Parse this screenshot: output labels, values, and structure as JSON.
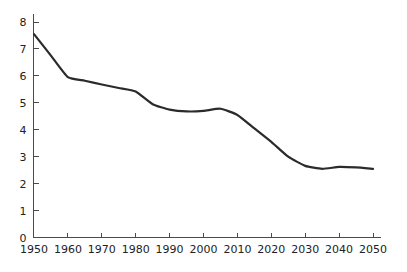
{
  "chart_data": {
    "type": "line",
    "title": "",
    "subtitle": "",
    "xlabel": "",
    "ylabel": "",
    "xlim": [
      1950,
      2050
    ],
    "ylim": [
      0,
      8
    ],
    "grid": false,
    "legend": null,
    "line_color": "#2b2b2b",
    "axis_color": "#4a4a4a",
    "background_color": "#ffffff",
    "x_ticks": [
      1950,
      1960,
      1970,
      1980,
      1990,
      2000,
      2010,
      2020,
      2030,
      2040,
      2050
    ],
    "x_tick_labels": [
      "1950",
      "1960",
      "1970",
      "1980",
      "1990",
      "2000",
      "2010",
      "2020",
      "2030",
      "2040",
      "2050"
    ],
    "y_ticks": [
      0,
      1,
      2,
      3,
      4,
      5,
      6,
      7,
      8
    ],
    "y_tick_labels": [
      "0",
      "1",
      "2",
      "3",
      "4",
      "5",
      "6",
      "7",
      "8"
    ],
    "series": [
      {
        "name": "series-1",
        "x": [
          1950,
          1955,
          1960,
          1965,
          1970,
          1975,
          1980,
          1985,
          1990,
          1995,
          2000,
          2005,
          2010,
          2015,
          2020,
          2025,
          2030,
          2035,
          2040,
          2045,
          2050
        ],
        "values": [
          7.55,
          6.75,
          5.95,
          5.82,
          5.68,
          5.55,
          5.42,
          4.95,
          4.75,
          4.68,
          4.7,
          4.78,
          4.55,
          4.05,
          3.55,
          3.0,
          2.66,
          2.55,
          2.62,
          2.6,
          2.55
        ]
      }
    ]
  }
}
